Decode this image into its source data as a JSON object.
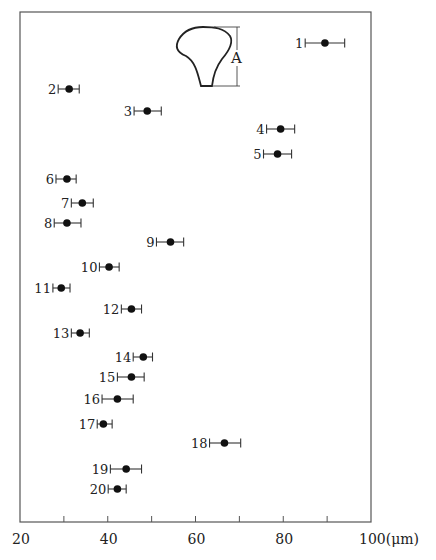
{
  "chart_data": {
    "type": "scatter",
    "title": "",
    "xlabel": "(μm)",
    "ylabel": "",
    "xlim": [
      20,
      100
    ],
    "x_ticks": [
      20,
      30,
      40,
      50,
      60,
      70,
      80,
      90,
      100
    ],
    "x_tick_labels": [
      "20",
      "40",
      "60",
      "80",
      "100(μm)"
    ],
    "x_tick_label_values": [
      20,
      40,
      60,
      80,
      100
    ],
    "grid": false,
    "legend": null,
    "annotation": {
      "label": "A",
      "description": "inset outline of a tooth-like shape with dimension A indicating its height"
    },
    "series": [
      {
        "name": "measurements (mean ± range)",
        "points": [
          {
            "id": "1",
            "value": 89.5,
            "low": 85.0,
            "high": 94.0
          },
          {
            "id": "2",
            "value": 31.2,
            "low": 28.7,
            "high": 33.5
          },
          {
            "id": "3",
            "value": 49.0,
            "low": 46.0,
            "high": 52.2
          },
          {
            "id": "4",
            "value": 79.4,
            "low": 76.2,
            "high": 82.6
          },
          {
            "id": "5",
            "value": 78.7,
            "low": 75.5,
            "high": 81.9
          },
          {
            "id": "6",
            "value": 30.7,
            "low": 28.2,
            "high": 32.8
          },
          {
            "id": "7",
            "value": 34.2,
            "low": 31.7,
            "high": 36.7
          },
          {
            "id": "8",
            "value": 30.7,
            "low": 27.8,
            "high": 33.9
          },
          {
            "id": "9",
            "value": 54.3,
            "low": 51.1,
            "high": 57.3
          },
          {
            "id": "10",
            "value": 40.3,
            "low": 38.1,
            "high": 42.6
          },
          {
            "id": "11",
            "value": 29.4,
            "low": 27.5,
            "high": 31.4
          },
          {
            "id": "12",
            "value": 45.4,
            "low": 43.1,
            "high": 47.7
          },
          {
            "id": "13",
            "value": 33.7,
            "low": 31.7,
            "high": 35.8
          },
          {
            "id": "14",
            "value": 48.1,
            "low": 45.8,
            "high": 50.2
          },
          {
            "id": "15",
            "value": 45.4,
            "low": 42.2,
            "high": 48.3
          },
          {
            "id": "16",
            "value": 42.2,
            "low": 38.7,
            "high": 45.8
          },
          {
            "id": "17",
            "value": 39.0,
            "low": 37.6,
            "high": 41.0
          },
          {
            "id": "18",
            "value": 66.6,
            "low": 63.2,
            "high": 70.3
          },
          {
            "id": "19",
            "value": 44.2,
            "low": 40.6,
            "high": 47.7
          },
          {
            "id": "20",
            "value": 42.2,
            "low": 40.1,
            "high": 44.2
          }
        ]
      }
    ],
    "row_y_px": [
      43,
      89,
      111,
      129,
      154,
      179,
      203,
      223,
      242,
      267,
      288,
      309,
      333,
      357,
      377,
      399,
      424,
      443,
      469,
      489
    ]
  }
}
